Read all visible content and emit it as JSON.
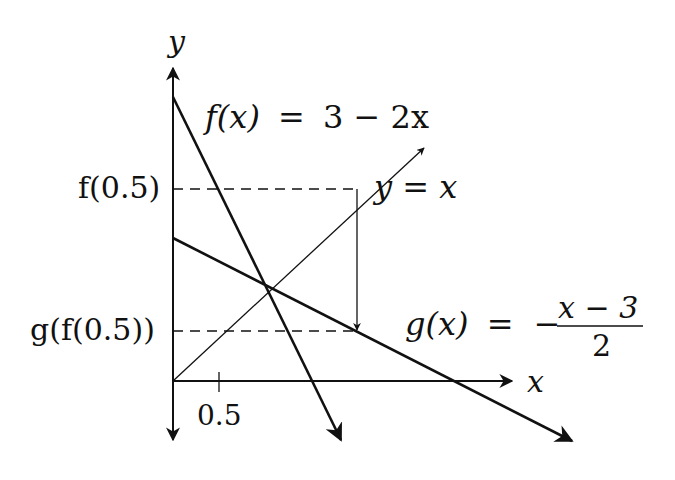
{
  "diagram": {
    "axes": {
      "x_label": "x",
      "y_label": "y",
      "x_tick_label": "0.5"
    },
    "curves": {
      "f": {
        "label_lhs": "f(x)",
        "label_eq": "=",
        "label_rhs": "3 − 2x",
        "expression": "3 - 2x"
      },
      "g": {
        "label_lhs": "g(x)",
        "label_eq": "=",
        "label_minus": "−",
        "numerator": "x − 3",
        "denominator": "2",
        "expression": "-(x - 3)/2"
      },
      "identity": {
        "label": "y = x"
      }
    },
    "markers": {
      "f_half": "f(0.5)",
      "g_f_half": "g(f(0.5))"
    },
    "colors": {
      "stroke": "#111111",
      "background": "#ffffff"
    }
  }
}
